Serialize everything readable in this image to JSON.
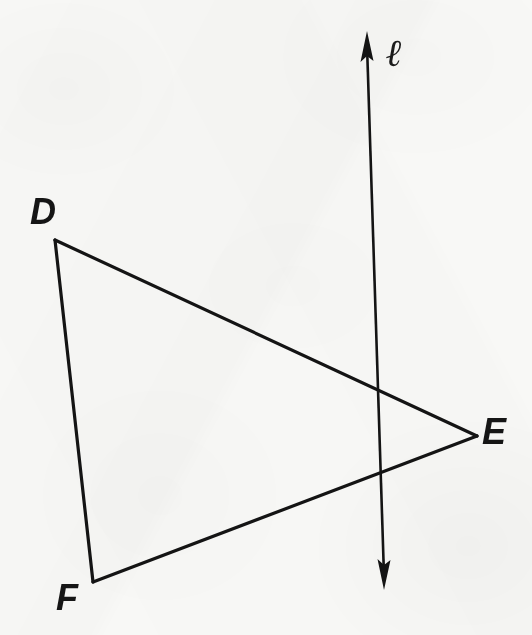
{
  "figure": {
    "type": "geometry-diagram",
    "background_color": "#f8f8f6",
    "stroke_color": "#141414",
    "stroke_width": 3,
    "canvas": {
      "width": 532,
      "height": 635
    },
    "labels": {
      "vertex_d": "D",
      "vertex_e": "E",
      "vertex_f": "F",
      "line": "ℓ"
    },
    "points": {
      "D": {
        "x": 55,
        "y": 240
      },
      "E": {
        "x": 477,
        "y": 436
      },
      "F": {
        "x": 93,
        "y": 582
      }
    },
    "segments": [
      {
        "name": "DE",
        "from": "D",
        "to": "E"
      },
      {
        "name": "EF",
        "from": "E",
        "to": "F"
      },
      {
        "name": "FD",
        "from": "F",
        "to": "D"
      }
    ],
    "line_l": {
      "name": "ℓ",
      "arrow_top": {
        "x": 367,
        "y": 31
      },
      "arrow_bottom": {
        "x": 384,
        "y": 590
      },
      "double_headed": true
    },
    "intersections": [
      {
        "segment": "DE",
        "x": 378,
        "y": 393
      },
      {
        "segment": "EF",
        "x": 382,
        "y": 478
      }
    ]
  }
}
